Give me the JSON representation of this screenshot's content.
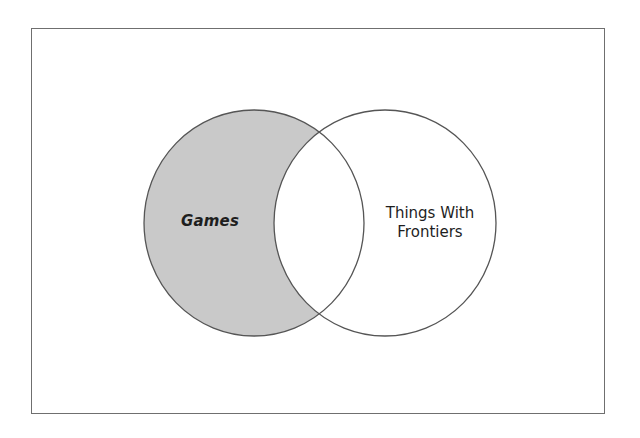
{
  "diagram": {
    "type": "venn",
    "frame": true,
    "sets": [
      {
        "id": "games",
        "label": "Games",
        "shading": "difference-only",
        "fill_color": "#c8c8c8",
        "stroke_color": "#555555"
      },
      {
        "id": "frontiers",
        "label_lines": [
          "Things With",
          "Frontiers"
        ],
        "label": "Things With Frontiers",
        "fill_color": "#ffffff",
        "stroke_color": "#555555"
      }
    ],
    "shaded_region": "Games minus Things With Frontiers"
  }
}
